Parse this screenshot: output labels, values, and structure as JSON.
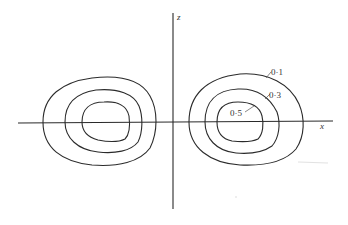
{
  "figure": {
    "axes": {
      "x_label": "x",
      "z_label": "z"
    },
    "contours": {
      "levels": [
        {
          "value": "0·1",
          "ring": "outer"
        },
        {
          "value": "0·3",
          "ring": "middle"
        },
        {
          "value": "0·5",
          "ring": "inner"
        }
      ],
      "lobes": [
        "left",
        "right"
      ]
    }
  }
}
